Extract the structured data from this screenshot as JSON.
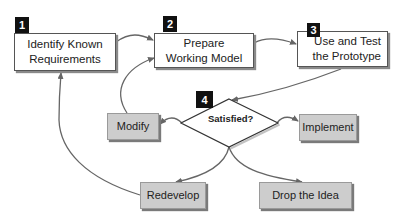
{
  "diagram": {
    "type": "prototyping-model-flowchart",
    "steps": [
      {
        "badge": "1",
        "label_line1": "Identify Known",
        "label_line2": "Requirements"
      },
      {
        "badge": "2",
        "label_line1": "Prepare",
        "label_line2": "Working Model"
      },
      {
        "badge": "3",
        "label_line1": "Use and Test",
        "label_line2": "the Prototype"
      },
      {
        "badge": "4",
        "label": "Satisfied?"
      }
    ],
    "outcomes": {
      "modify": "Modify",
      "implement": "Implement",
      "redevelop": "Redevelop",
      "drop": "Drop the Idea"
    },
    "colors": {
      "badge_bg": "#111111",
      "outcome_box_bg": "#cdcdcd",
      "step_box_bg": "#ffffff",
      "arrow": "#666666"
    },
    "edges": [
      {
        "from": "Identify Known Requirements",
        "to": "Prepare Working Model"
      },
      {
        "from": "Prepare Working Model",
        "to": "Use and Test the Prototype"
      },
      {
        "from": "Use and Test the Prototype",
        "to": "Satisfied?"
      },
      {
        "from": "Satisfied?",
        "to": "Modify"
      },
      {
        "from": "Satisfied?",
        "to": "Implement"
      },
      {
        "from": "Satisfied?",
        "to": "Redevelop"
      },
      {
        "from": "Satisfied?",
        "to": "Drop the Idea"
      },
      {
        "from": "Modify",
        "to": "Prepare Working Model"
      },
      {
        "from": "Redevelop",
        "to": "Identify Known Requirements"
      }
    ]
  }
}
